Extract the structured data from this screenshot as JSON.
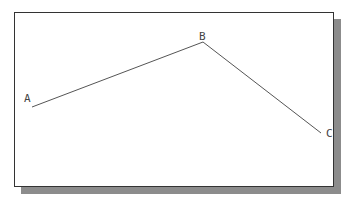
{
  "diagram": {
    "type": "polyline",
    "colors": {
      "frame_border": "#333333",
      "shadow": "#8c8c8c",
      "line": "#555555",
      "label": "#444444",
      "background": "#ffffff"
    },
    "points": [
      {
        "label": "A",
        "x": 32,
        "y": 107
      },
      {
        "label": "B",
        "x": 203,
        "y": 42
      },
      {
        "label": "C",
        "x": 321,
        "y": 133
      }
    ],
    "segments": [
      {
        "from": "A",
        "to": "B"
      },
      {
        "from": "B",
        "to": "C"
      }
    ]
  }
}
